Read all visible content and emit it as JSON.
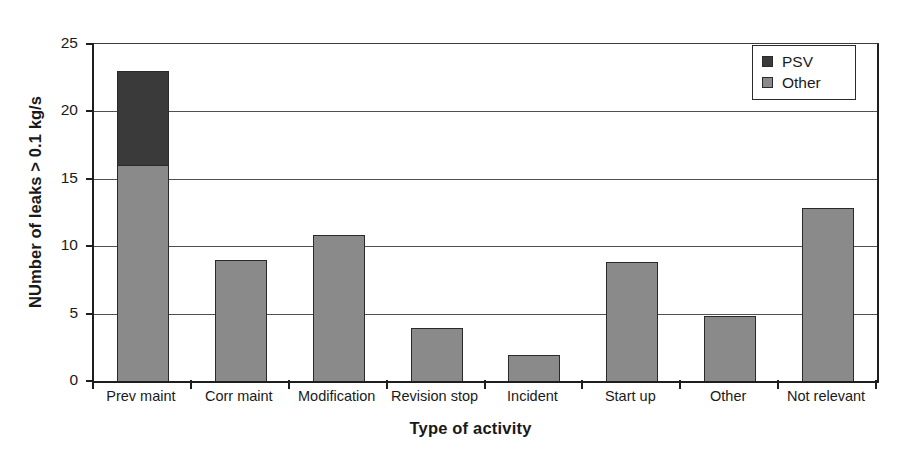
{
  "chart_data": {
    "type": "bar",
    "subtype": "stacked-bar",
    "title": "",
    "xlabel": "Type of activity",
    "ylabel": "NUmber of leaks > 0.1 kg/s",
    "categories": [
      "Prev maint",
      "Corr maint",
      "Modification",
      "Revision stop",
      "Incident",
      "Start up",
      "Other",
      "Not relevant"
    ],
    "series": [
      {
        "name": "Other",
        "color": "#8a8a8a",
        "values": [
          16,
          9,
          10.8,
          3.9,
          1.9,
          8.8,
          4.8,
          12.8
        ]
      },
      {
        "name": "PSV",
        "color": "#3a3a3a",
        "values": [
          7,
          0,
          0,
          0,
          0,
          0,
          0,
          0
        ]
      }
    ],
    "totals": [
      23,
      9,
      10.8,
      3.9,
      1.9,
      8.8,
      4.8,
      12.8
    ],
    "ylim": [
      0,
      25
    ],
    "yticks": [
      0,
      5,
      10,
      15,
      20,
      25
    ],
    "ytick_labels": [
      "0",
      "5",
      "10",
      "15",
      "20",
      "25"
    ],
    "grid": "horizontal",
    "legend_position": "top-right",
    "legend_entries": [
      "PSV",
      "Other"
    ]
  }
}
